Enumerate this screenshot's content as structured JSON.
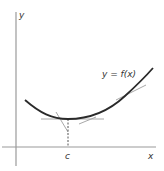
{
  "diagram": {
    "axis_labels": {
      "y": "y",
      "x": "x"
    },
    "curve_label": "y = f(x)",
    "point_label": "c",
    "colors": {
      "axis": "#9a9a9a",
      "curve": "#2a2a2a",
      "tangent": "#a8a8a8",
      "dashed": "#555555",
      "text": "#333333"
    }
  }
}
